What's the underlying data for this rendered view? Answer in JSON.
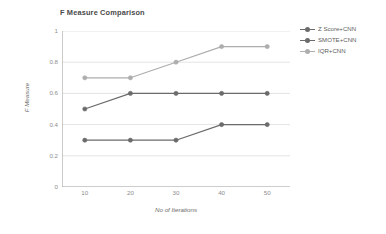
{
  "chart_data": {
    "type": "line",
    "title": "F Measure Comparison",
    "xlabel": "No of Iterations",
    "ylabel": "F Measure",
    "categories": [
      "10",
      "20",
      "30",
      "40",
      "50"
    ],
    "x": [
      10,
      20,
      30,
      40,
      50
    ],
    "ylim": [
      0,
      1
    ],
    "yticks": [
      "0",
      "0.2",
      "0.4",
      "0.6",
      "0.8",
      "1"
    ],
    "ytick_values": [
      0,
      0.2,
      0.4,
      0.6,
      0.8,
      1
    ],
    "grid": "horizontal",
    "legend_position": "right",
    "series": [
      {
        "name": "Z Score+CNN",
        "values": [
          0.3,
          0.3,
          0.3,
          0.4,
          0.4
        ],
        "color": "#6b6b6b"
      },
      {
        "name": "SMOTE+CNN",
        "values": [
          0.5,
          0.6,
          0.6,
          0.6,
          0.6
        ],
        "color": "#6b6b6b"
      },
      {
        "name": "IQR+CNN",
        "values": [
          0.7,
          0.7,
          0.8,
          0.9,
          0.9
        ],
        "color": "#adadad"
      }
    ]
  },
  "colors": {
    "background": "#ffffff",
    "gridline": "#e4e4e4",
    "axis": "#9a9a9a",
    "text": "#5a5a5a",
    "tick_text": "#8d8d8d",
    "series_dark": "#6b6b6b",
    "series_light": "#adadad"
  }
}
